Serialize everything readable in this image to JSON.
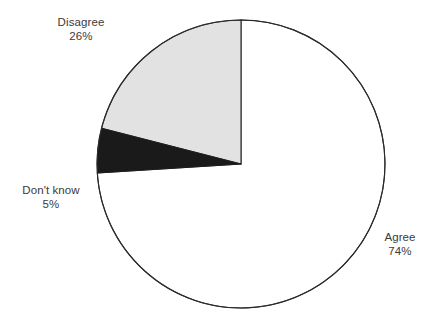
{
  "chart_data": {
    "type": "pie",
    "title": "",
    "subtitle": "",
    "xlabel": "",
    "ylabel": "",
    "legend_position": "none",
    "grid": false,
    "labels_outside": true,
    "start_angle_deg": 0,
    "direction": "clockwise",
    "categories": [
      "Agree",
      "Disagree",
      "Don't know"
    ],
    "values": [
      74,
      26,
      5
    ],
    "value_unit": "%",
    "slices": [
      {
        "name": "Agree",
        "value": 74,
        "value_text": "74%",
        "fill": "#ffffff",
        "stroke": "#2b2b2b",
        "start_deg": 0,
        "end_deg": 266.4
      },
      {
        "name": "Don't know",
        "value": 5,
        "value_text": "5%",
        "fill": "#1a1a1a",
        "stroke": "#1a1a1a",
        "start_deg": 266.4,
        "end_deg": 284.4
      },
      {
        "name": "Disagree",
        "value": 26,
        "value_text": "26%",
        "fill": "#e2e2e2",
        "stroke": "#2b2b2b",
        "start_deg": 284.4,
        "end_deg": 360
      }
    ]
  },
  "labels": {
    "disagree": {
      "name": "Disagree",
      "value": "26%"
    },
    "dont_know": {
      "name": "Don't know",
      "value": "5%"
    },
    "agree": {
      "name": "Agree",
      "value": "74%"
    }
  },
  "colors": {
    "background": "#ffffff",
    "outline": "#2b2b2b",
    "text": "#3b3b3b",
    "slice_agree": "#ffffff",
    "slice_disagree": "#e2e2e2",
    "slice_dont_know": "#1a1a1a"
  }
}
